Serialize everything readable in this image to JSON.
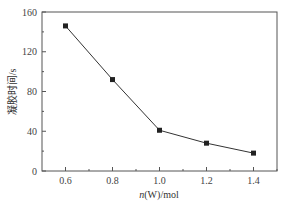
{
  "chart_data": {
    "type": "line",
    "title": "",
    "xlabel_italic": "n",
    "xlabel_rest": "(W)/mol",
    "xlabel": "n(W)/mol",
    "ylabel": "凝胶时间/s",
    "x": [
      0.6,
      0.8,
      1.0,
      1.2,
      1.4
    ],
    "series": [
      {
        "name": "凝胶时间",
        "values": [
          146,
          92,
          41,
          28,
          18
        ],
        "marker": "square",
        "color": "#222222"
      }
    ],
    "xlim": [
      0.5,
      1.5
    ],
    "ylim": [
      0,
      160
    ],
    "xticks": [
      "0.6",
      "0.8",
      "1.0",
      "1.2",
      "1.4"
    ],
    "yticks": [
      "0",
      "40",
      "80",
      "120",
      "160"
    ],
    "grid": false,
    "legend": null
  }
}
